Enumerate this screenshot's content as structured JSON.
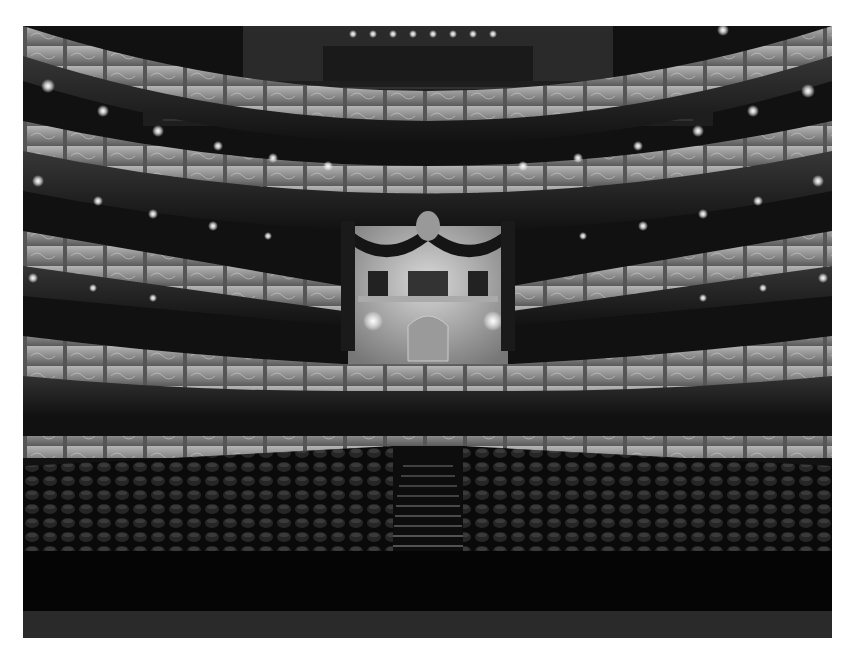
{
  "image": {
    "subject": "Grayscale photograph of an empty opera house interior viewed from the stage",
    "colors": {
      "background": "#ffffff",
      "balcony_front": "#8a8a8a",
      "balcony_highlight": "#b8b8b8",
      "shadow": "#0c0c0c",
      "seat": "#1a1a1a",
      "light": "#ffffff"
    },
    "elements": {
      "tiers": 5,
      "royal_box": "Central royal box with draped curtains and crest",
      "aisle": "Central stepped aisle through orchestra seating",
      "stage_edge": "Dark stage floor in foreground"
    }
  }
}
